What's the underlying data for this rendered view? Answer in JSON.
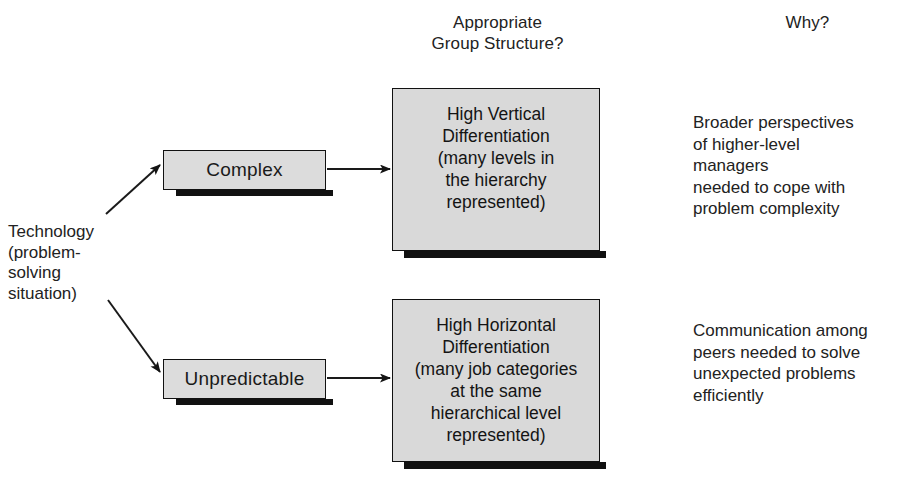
{
  "headers": {
    "structure": "Appropriate\nGroup Structure?",
    "why": "Why?"
  },
  "source": {
    "label": "Technology\n(problem-\nsolving\nsituation)"
  },
  "conditions": [
    {
      "label": "Complex"
    },
    {
      "label": "Unpredictable"
    }
  ],
  "structures": [
    {
      "label": "High Vertical\nDifferentiation\n(many levels in\nthe hierarchy\nrepresented)"
    },
    {
      "label": "High Horizontal\nDifferentiation\n(many job categories\nat the same\nhierarchical level\nrepresented)"
    }
  ],
  "reasons": [
    {
      "label": "Broader perspectives\nof higher-level\nmanagers\nneeded to cope with\nproblem complexity"
    },
    {
      "label": "Communication among\npeers needed to solve\nunexpected problems\nefficiently"
    }
  ],
  "colors": {
    "background": "#ffffff",
    "box_fill": "#dcdcdc",
    "box_fill_large": "#d9d9d9",
    "box_border": "#111111",
    "shadow": "#111111",
    "text": "#1a1a1a",
    "connector": "#1a1a1a"
  }
}
